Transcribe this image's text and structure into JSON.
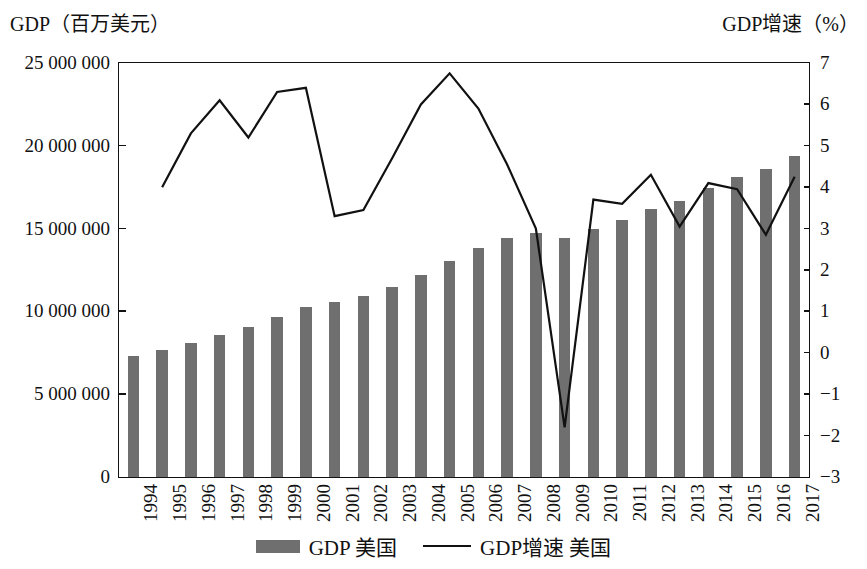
{
  "axis_titles": {
    "left": "GDP（百万美元）",
    "right": "GDP增速（%）"
  },
  "legend": {
    "bar_label": "GDP 美国",
    "line_label": "GDP增速 美国"
  },
  "colors": {
    "bar": "#6f6f6f",
    "line": "#111111",
    "axis": "#111111",
    "background": "#ffffff"
  },
  "chart_data": {
    "type": "bar",
    "title": "",
    "subtitle": "",
    "xlabel": "",
    "ylabel": "GDP（百万美元）",
    "y2label": "GDP增速（%）",
    "grid": false,
    "legend_position": "bottom",
    "categories": [
      "1994",
      "1995",
      "1996",
      "1997",
      "1998",
      "1999",
      "2000",
      "2001",
      "2002",
      "2003",
      "2004",
      "2005",
      "2006",
      "2007",
      "2008",
      "2009",
      "2010",
      "2011",
      "2012",
      "2013",
      "2014",
      "2015",
      "2016",
      "2017"
    ],
    "ylim": [
      0,
      25000000
    ],
    "yticks": [
      0,
      5000000,
      10000000,
      15000000,
      20000000,
      25000000
    ],
    "ytick_labels": [
      "0",
      "5 000 000",
      "10 000 000",
      "15 000 000",
      "20 000 000",
      "25 000 000"
    ],
    "y2lim": [
      -3,
      7
    ],
    "y2ticks": [
      -3,
      -2,
      -1,
      0,
      1,
      2,
      3,
      4,
      5,
      6,
      7
    ],
    "y2tick_labels": [
      "−3",
      "−2",
      "−1",
      "0",
      "1",
      "2",
      "3",
      "4",
      "5",
      "6",
      "7"
    ],
    "series": [
      {
        "name": "GDP 美国",
        "type": "bar",
        "axis": "left",
        "unit": "百万美元",
        "values": [
          7300000,
          7650000,
          8070000,
          8570000,
          9060000,
          9660000,
          10250000,
          10580000,
          10940000,
          11460000,
          12210000,
          13040000,
          13810000,
          14450000,
          14710000,
          14450000,
          14990000,
          15540000,
          16200000,
          16690000,
          17430000,
          18120000,
          18620000,
          19390000
        ]
      },
      {
        "name": "GDP增速 美国",
        "type": "line",
        "axis": "right",
        "unit": "%",
        "values": [
          null,
          4.0,
          5.3,
          6.1,
          5.2,
          6.3,
          6.4,
          3.3,
          3.45,
          4.7,
          6.0,
          6.75,
          5.9,
          4.55,
          3.0,
          -1.8,
          3.7,
          3.6,
          4.3,
          3.05,
          4.1,
          3.95,
          2.85,
          4.25
        ]
      }
    ]
  }
}
